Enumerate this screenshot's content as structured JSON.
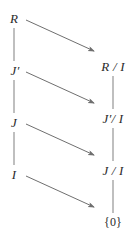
{
  "diagram": {
    "type": "lattice-correspondence-diagram",
    "colors": {
      "text": "#2b2b2b",
      "line": "#8a8a8a",
      "arrow": "#6f6f6f",
      "background": "#ffffff"
    },
    "left_column": {
      "name": "ideal-chain",
      "nodes": [
        {
          "id": "R",
          "label": "R",
          "x": 14,
          "y": 18,
          "style": "italic"
        },
        {
          "id": "Jp",
          "label": "J′",
          "x": 15,
          "y": 70,
          "style": "italic"
        },
        {
          "id": "J",
          "label": "J",
          "x": 14,
          "y": 122,
          "style": "italic"
        },
        {
          "id": "I",
          "label": "I",
          "x": 14,
          "y": 174,
          "style": "italic"
        }
      ]
    },
    "right_column": {
      "name": "quotient-chain",
      "nodes": [
        {
          "id": "RI",
          "label": "R / I",
          "x": 113,
          "y": 66,
          "style": "italic"
        },
        {
          "id": "JpI",
          "label": "J′/ I",
          "x": 113,
          "y": 118,
          "style": "italic"
        },
        {
          "id": "JI",
          "label": "J / I",
          "x": 113,
          "y": 170,
          "style": "italic"
        },
        {
          "id": "zero",
          "label": "{0}",
          "x": 113,
          "y": 222,
          "style": "upright"
        }
      ]
    },
    "vertical_connectors": [
      {
        "id": "R-to-Jp",
        "from": "R",
        "to": "Jp",
        "x": 14,
        "y1": 28,
        "y2": 61
      },
      {
        "id": "Jp-to-J",
        "from": "Jp",
        "to": "J",
        "x": 14,
        "y1": 80,
        "y2": 113
      },
      {
        "id": "J-to-I",
        "from": "J",
        "to": "I",
        "x": 14,
        "y1": 132,
        "y2": 165
      },
      {
        "id": "RI-to-JpI",
        "from": "RI",
        "to": "JpI",
        "x": 113,
        "y1": 76,
        "y2": 109
      },
      {
        "id": "JpI-to-JI",
        "from": "JpI",
        "to": "JI",
        "x": 113,
        "y1": 128,
        "y2": 161
      },
      {
        "id": "JI-to-zero",
        "from": "JI",
        "to": "zero",
        "x": 113,
        "y1": 180,
        "y2": 213
      }
    ],
    "arrows": [
      {
        "id": "R-to-RI",
        "from": "R",
        "to": "RI",
        "x1": 26,
        "y1": 20,
        "x2": 96,
        "y2": 52
      },
      {
        "id": "Jp-to-JpI",
        "from": "Jp",
        "to": "JpI",
        "x1": 26,
        "y1": 72,
        "x2": 96,
        "y2": 104
      },
      {
        "id": "J-to-JI",
        "from": "J",
        "to": "JI",
        "x1": 26,
        "y1": 124,
        "x2": 96,
        "y2": 156
      },
      {
        "id": "I-to-zero",
        "from": "I",
        "to": "zero",
        "x1": 26,
        "y1": 176,
        "x2": 96,
        "y2": 208
      }
    ]
  }
}
